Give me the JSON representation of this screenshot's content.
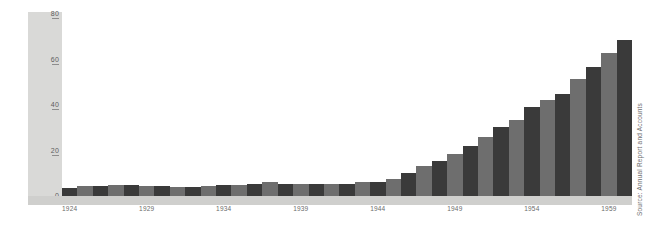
{
  "title": {
    "range": "1924–1960",
    "unit": "£ MILLION"
  },
  "source_note": "Source: Annual Report and Accounts",
  "colors": {
    "bar_dark": "#3a3a3a",
    "bar_light": "#6e6e6e",
    "axis_panel": "#d9d9d7",
    "xaxis_strip": "#cfcfcd",
    "text": "#2b2b2b",
    "tick_text": "#6a6a6a",
    "background": "#ffffff"
  },
  "chart_data": {
    "type": "bar",
    "subtitle": "",
    "xlabel": "",
    "ylabel": "£ MILLION",
    "ylim": [
      0,
      80
    ],
    "yticks": [
      0,
      20,
      40,
      60,
      80
    ],
    "ytick_labels": [
      "0",
      "20",
      "40",
      "60",
      "80"
    ],
    "grid": false,
    "legend": false,
    "legend_position": "none",
    "annotations": [
      "Source: Annual Report and Accounts"
    ],
    "xtick_labels": [
      "1924",
      "1929",
      "1934",
      "1939",
      "1944",
      "1949",
      "1954",
      "1959"
    ],
    "xtick_indices": [
      0,
      5,
      10,
      15,
      20,
      25,
      30,
      35
    ],
    "categories": [
      "1924",
      "1925",
      "1926",
      "1927",
      "1928",
      "1929",
      "1930",
      "1931",
      "1932",
      "1933",
      "1934",
      "1935",
      "1936",
      "1937",
      "1938",
      "1939",
      "1940",
      "1941",
      "1942",
      "1943",
      "1944",
      "1945",
      "1946",
      "1947",
      "1948",
      "1949",
      "1950",
      "1951",
      "1952",
      "1953",
      "1954",
      "1955",
      "1956",
      "1957",
      "1958",
      "1959",
      "1960"
    ],
    "values": [
      3.5,
      4.5,
      4.5,
      5.0,
      5.0,
      4.5,
      4.5,
      4.0,
      4.0,
      4.5,
      5.0,
      5.0,
      5.5,
      6.0,
      5.5,
      5.5,
      5.5,
      5.5,
      5.5,
      6.0,
      6.0,
      7.5,
      10.0,
      13.0,
      15.5,
      18.5,
      22.0,
      26.0,
      30.5,
      33.5,
      39.0,
      42.0,
      45.0,
      51.5,
      56.5,
      63.0,
      68.5
    ],
    "bar_shades": [
      "dark",
      "light",
      "dark",
      "light",
      "dark",
      "light",
      "dark",
      "light",
      "dark",
      "light",
      "dark",
      "light",
      "dark",
      "light",
      "dark",
      "light",
      "dark",
      "light",
      "dark",
      "light",
      "dark",
      "light",
      "dark",
      "light",
      "dark",
      "light",
      "dark",
      "light",
      "dark",
      "light",
      "dark",
      "light",
      "dark",
      "light",
      "dark",
      "light",
      "dark"
    ]
  }
}
